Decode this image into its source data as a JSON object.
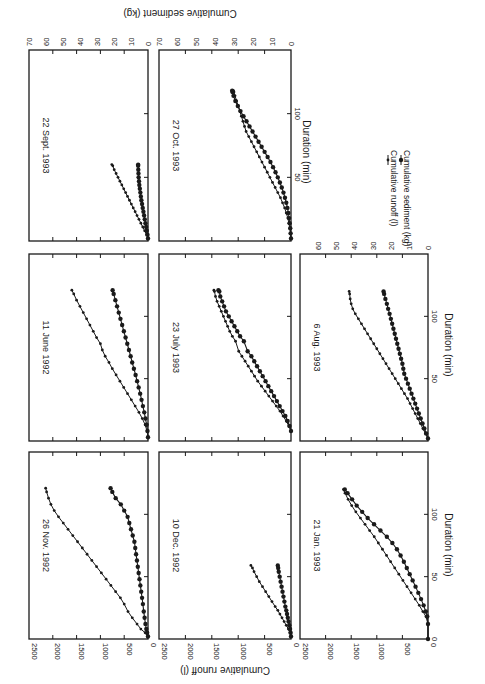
{
  "figure": {
    "rotation_deg": 90,
    "legend": {
      "runoff_label": "Cumulative runoff (l)",
      "sediment_label": "Cumulative sediment (kg)"
    },
    "shared_labels": {
      "xlabel": "Duration (min)",
      "ylabel_left": "Cumulative runoff (l)",
      "ylabel_right": "Cumulative sediment (kg)"
    }
  },
  "chart_data": [
    {
      "type": "line",
      "title": "26 Nov. 1992",
      "xlabel": "",
      "ylabel": "Cumulative runoff (l)",
      "y2label": "",
      "xlim": [
        0,
        150
      ],
      "ylim": [
        0,
        2500
      ],
      "y2lim": [
        0,
        70
      ],
      "xticks": [
        50,
        100
      ],
      "yticks": [
        0,
        500,
        1000,
        1500,
        2000,
        2500
      ],
      "y2ticks": [],
      "series": [
        {
          "name": "Cumulative runoff (l)",
          "axis": "left",
          "x": [
            2,
            5,
            8,
            12,
            17,
            22,
            28,
            33,
            38,
            43,
            48,
            53,
            58,
            63,
            68,
            73,
            78,
            83,
            88,
            93,
            98,
            103,
            108,
            113,
            118,
            121
          ],
          "y": [
            0,
            60,
            150,
            230,
            330,
            420,
            500,
            580,
            680,
            780,
            880,
            980,
            1080,
            1180,
            1280,
            1380,
            1480,
            1580,
            1680,
            1780,
            1880,
            1970,
            2040,
            2090,
            2130,
            2150
          ]
        },
        {
          "name": "Cumulative sediment (kg)",
          "axis": "right",
          "x": [
            2,
            5,
            8,
            12,
            17,
            22,
            28,
            33,
            38,
            43,
            48,
            53,
            58,
            63,
            68,
            73,
            78,
            83,
            88,
            93,
            98,
            103,
            108,
            113,
            118,
            121
          ],
          "y": [
            0,
            0.5,
            1,
            1.5,
            2,
            2.5,
            3,
            3.5,
            4,
            4.5,
            5,
            5.5,
            6,
            6.5,
            7,
            7.5,
            8,
            9,
            10,
            11,
            12,
            14,
            16,
            19,
            21,
            22
          ]
        }
      ]
    },
    {
      "type": "line",
      "title": "11 June 1992",
      "xlim": [
        0,
        150
      ],
      "ylim": [
        0,
        2500
      ],
      "y2lim": [
        0,
        70
      ],
      "xticks": [
        50,
        100
      ],
      "yticks": [
        0,
        500,
        1000,
        1500,
        2000,
        2500
      ],
      "series": [
        {
          "name": "Cumulative runoff (l)",
          "axis": "left",
          "x": [
            3,
            8,
            13,
            18,
            23,
            28,
            33,
            38,
            43,
            48,
            53,
            58,
            63,
            68,
            73,
            78,
            83,
            88,
            93,
            98,
            103,
            108,
            113,
            118,
            121
          ],
          "y": [
            0,
            20,
            60,
            120,
            190,
            270,
            350,
            430,
            510,
            590,
            670,
            750,
            820,
            900,
            960,
            1000,
            1080,
            1150,
            1220,
            1290,
            1360,
            1430,
            1500,
            1560,
            1600
          ]
        },
        {
          "name": "Cumulative sediment (kg)",
          "axis": "right",
          "x": [
            3,
            8,
            13,
            18,
            23,
            28,
            33,
            38,
            43,
            48,
            53,
            58,
            63,
            68,
            73,
            78,
            83,
            88,
            93,
            98,
            103,
            108,
            113,
            118,
            121
          ],
          "y": [
            0,
            0.3,
            0.8,
            1.5,
            2.2,
            3,
            3.8,
            4.6,
            5.5,
            6.4,
            7.3,
            8.3,
            9.3,
            10.2,
            11.2,
            12.2,
            13.2,
            14.2,
            15.2,
            16.2,
            17.2,
            18.2,
            19.2,
            20.2,
            20.8
          ]
        }
      ]
    },
    {
      "type": "line",
      "title": "22 Sept. 1993",
      "xlim": [
        0,
        150
      ],
      "ylim": [
        0,
        2500
      ],
      "y2lim": [
        0,
        70
      ],
      "xticks": [
        50,
        100
      ],
      "yticks": [
        0,
        500,
        1000,
        1500,
        2000,
        2500
      ],
      "y2ticks": [
        0,
        10,
        20,
        30,
        40,
        50,
        60,
        70
      ],
      "series": [
        {
          "name": "Cumulative runoff (l)",
          "axis": "left",
          "x": [
            2,
            5,
            8,
            11,
            14,
            17,
            20,
            23,
            26,
            29,
            32,
            35,
            38,
            41,
            44,
            47,
            50,
            53,
            56,
            59,
            60
          ],
          "y": [
            0,
            30,
            70,
            110,
            150,
            190,
            230,
            270,
            310,
            350,
            390,
            430,
            470,
            510,
            550,
            590,
            630,
            670,
            710,
            740,
            760
          ]
        },
        {
          "name": "Cumulative sediment (kg)",
          "axis": "right",
          "x": [
            2,
            5,
            8,
            11,
            14,
            17,
            20,
            23,
            26,
            29,
            32,
            35,
            38,
            41,
            44,
            47,
            50,
            53,
            56,
            59,
            60
          ],
          "y": [
            0,
            0.3,
            0.7,
            1.1,
            1.5,
            1.9,
            2.3,
            2.7,
            3.1,
            3.5,
            3.9,
            4.2,
            4.5,
            4.8,
            5.1,
            5.3,
            5.5,
            5.6,
            5.7,
            5.8,
            5.8
          ]
        }
      ]
    },
    {
      "type": "line",
      "title": "10 Dec. 1992",
      "xlim": [
        0,
        150
      ],
      "ylim": [
        0,
        2500
      ],
      "y2lim": [
        0,
        70
      ],
      "xticks": [
        50,
        100
      ],
      "yticks": [
        0,
        500,
        1000,
        1500,
        2000,
        2500
      ],
      "series": [
        {
          "name": "Cumulative runoff (l)",
          "axis": "left",
          "x": [
            2,
            5,
            8,
            11,
            14,
            17,
            20,
            23,
            26,
            30,
            34,
            38,
            42,
            46,
            50,
            54,
            57,
            59
          ],
          "y": [
            0,
            20,
            50,
            90,
            130,
            170,
            210,
            250,
            300,
            360,
            420,
            480,
            540,
            600,
            650,
            700,
            730,
            760
          ]
        },
        {
          "name": "Cumulative sediment (kg)",
          "axis": "right",
          "x": [
            2,
            5,
            8,
            11,
            14,
            17,
            20,
            23,
            26,
            30,
            34,
            38,
            42,
            46,
            50,
            54,
            57,
            59
          ],
          "y": [
            0,
            0.2,
            0.5,
            0.9,
            1.3,
            1.7,
            2.1,
            2.5,
            3,
            3.5,
            4,
            4.5,
            5,
            5.5,
            6,
            6.5,
            6.8,
            7
          ]
        }
      ]
    },
    {
      "type": "line",
      "title": "23 July 1993",
      "xlim": [
        0,
        150
      ],
      "ylim": [
        0,
        2500
      ],
      "y2lim": [
        0,
        70
      ],
      "xticks": [
        50,
        100
      ],
      "yticks": [
        0,
        500,
        1000,
        1500,
        2000,
        2500
      ],
      "series": [
        {
          "name": "Cumulative runoff (l)",
          "axis": "left",
          "x": [
            8,
            12,
            16,
            20,
            24,
            28,
            32,
            36,
            40,
            44,
            48,
            52,
            56,
            60,
            64,
            68,
            72,
            80,
            84,
            88,
            92,
            96,
            100,
            104,
            108,
            112,
            116,
            120,
            121
          ],
          "y": [
            0,
            40,
            90,
            150,
            210,
            280,
            350,
            420,
            490,
            560,
            630,
            690,
            750,
            810,
            870,
            930,
            990,
            1050,
            1110,
            1160,
            1200,
            1240,
            1280,
            1320,
            1360,
            1400,
            1430,
            1450,
            1460
          ]
        },
        {
          "name": "Cumulative sediment (kg)",
          "axis": "right",
          "x": [
            8,
            12,
            16,
            20,
            24,
            28,
            32,
            36,
            40,
            44,
            48,
            52,
            56,
            60,
            64,
            68,
            72,
            80,
            84,
            88,
            92,
            96,
            100,
            104,
            108,
            112,
            116,
            120,
            121
          ],
          "y": [
            0,
            0.8,
            1.8,
            3,
            4.5,
            6,
            7.5,
            9,
            10.5,
            12,
            13.5,
            15,
            16.5,
            18,
            19.5,
            21,
            23,
            25,
            27,
            28.5,
            30,
            31.5,
            33,
            34.5,
            35.5,
            36.5,
            37.5,
            38,
            38.5
          ]
        }
      ]
    },
    {
      "type": "line",
      "title": "27 Oct. 1993",
      "xlim": [
        0,
        150
      ],
      "ylim": [
        0,
        2500
      ],
      "y2lim": [
        0,
        70
      ],
      "xticks": [
        50,
        100
      ],
      "yticks": [
        0,
        500,
        1000,
        1500,
        2000,
        2500
      ],
      "y2ticks": [
        0,
        10,
        20,
        30,
        40,
        50,
        60,
        70
      ],
      "series": [
        {
          "name": "Cumulative runoff (l)",
          "axis": "left",
          "x": [
            2,
            6,
            10,
            14,
            18,
            22,
            26,
            30,
            34,
            38,
            42,
            46,
            50,
            54,
            58,
            62,
            66,
            70,
            74,
            78,
            82,
            86,
            90,
            94,
            98,
            102,
            106,
            110,
            114,
            117,
            118
          ],
          "y": [
            0,
            10,
            20,
            40,
            60,
            90,
            120,
            160,
            200,
            250,
            300,
            350,
            400,
            450,
            500,
            550,
            600,
            650,
            700,
            750,
            800,
            850,
            880,
            910,
            940,
            970,
            1000,
            1030,
            1060,
            1080,
            1090
          ]
        },
        {
          "name": "Cumulative sediment (kg)",
          "axis": "right",
          "x": [
            2,
            6,
            10,
            14,
            18,
            22,
            26,
            30,
            34,
            38,
            42,
            46,
            50,
            54,
            58,
            62,
            66,
            70,
            74,
            78,
            82,
            86,
            90,
            94,
            98,
            102,
            106,
            110,
            114,
            117,
            118
          ],
          "y": [
            0,
            0.2,
            0.4,
            0.7,
            1,
            1.4,
            1.9,
            2.5,
            3.2,
            4,
            4.9,
            5.9,
            7,
            8.2,
            9.5,
            10.9,
            12.4,
            14,
            15.6,
            17.2,
            18.8,
            20.4,
            22,
            23.6,
            25.2,
            26.8,
            28.2,
            29.5,
            30.5,
            31,
            31.2
          ]
        }
      ]
    },
    {
      "type": "line",
      "title": "21 Jan. 1993",
      "xlim": [
        0,
        150
      ],
      "ylim": [
        0,
        2500
      ],
      "y2lim": [
        0,
        70
      ],
      "xticks": [
        0,
        50,
        100
      ],
      "yticks": [
        0,
        500,
        1000,
        1500,
        2000,
        2500
      ],
      "series": [
        {
          "name": "Cumulative runoff (l)",
          "axis": "left",
          "x": [
            0,
            12,
            18,
            22,
            27,
            32,
            37,
            42,
            47,
            52,
            57,
            62,
            67,
            72,
            77,
            82,
            87,
            92,
            97,
            102,
            107,
            112,
            117,
            120
          ],
          "y": [
            0,
            0,
            40,
            100,
            170,
            250,
            330,
            410,
            490,
            570,
            650,
            730,
            810,
            890,
            970,
            1050,
            1140,
            1230,
            1320,
            1410,
            1490,
            1560,
            1620,
            1650
          ]
        },
        {
          "name": "Cumulative sediment (kg)",
          "axis": "right",
          "x": [
            0,
            12,
            18,
            22,
            27,
            32,
            37,
            42,
            47,
            52,
            57,
            62,
            67,
            72,
            77,
            82,
            87,
            92,
            97,
            102,
            107,
            112,
            117,
            120
          ],
          "y": [
            0,
            0,
            0.4,
            1.2,
            2.4,
            3.8,
            5.3,
            6.8,
            8.4,
            10,
            11.6,
            13.2,
            15,
            17,
            19.5,
            22.5,
            26,
            29.5,
            33,
            36,
            39,
            41.5,
            44,
            45.5
          ]
        }
      ]
    },
    {
      "type": "line",
      "title": "6 Aug. 1993",
      "xlim": [
        0,
        150
      ],
      "ylim": [
        0,
        2500
      ],
      "y2lim": [
        0,
        70
      ],
      "xticks": [
        50,
        100
      ],
      "yticks": [],
      "y2ticks": [
        0,
        10,
        20,
        30,
        40,
        50,
        60
      ],
      "series": [
        {
          "name": "Cumulative runoff (l)",
          "axis": "left",
          "x": [
            2,
            6,
            10,
            14,
            18,
            22,
            26,
            30,
            34,
            38,
            42,
            46,
            50,
            54,
            58,
            62,
            66,
            70,
            74,
            78,
            82,
            86,
            90,
            94,
            98,
            102,
            106,
            110,
            114,
            118,
            120
          ],
          "y": [
            0,
            50,
            100,
            150,
            200,
            250,
            300,
            350,
            400,
            460,
            520,
            580,
            640,
            700,
            760,
            820,
            880,
            940,
            1000,
            1060,
            1120,
            1180,
            1240,
            1300,
            1360,
            1420,
            1470,
            1500,
            1520,
            1530,
            1540
          ]
        },
        {
          "name": "Cumulative sediment (kg)",
          "axis": "right",
          "x": [
            2,
            6,
            10,
            14,
            18,
            22,
            26,
            30,
            34,
            38,
            42,
            46,
            50,
            54,
            58,
            62,
            66,
            70,
            74,
            78,
            82,
            86,
            90,
            94,
            98,
            102,
            106,
            110,
            114,
            118,
            120
          ],
          "y": [
            0,
            1,
            2,
            3,
            4,
            5,
            6,
            7,
            8,
            9,
            10,
            11,
            12,
            13,
            13.5,
            14,
            14.7,
            15.4,
            16.1,
            16.8,
            17.5,
            18.2,
            18.9,
            19.6,
            20.3,
            21,
            21.8,
            22.5,
            23.3,
            24,
            24.3
          ]
        }
      ]
    }
  ]
}
